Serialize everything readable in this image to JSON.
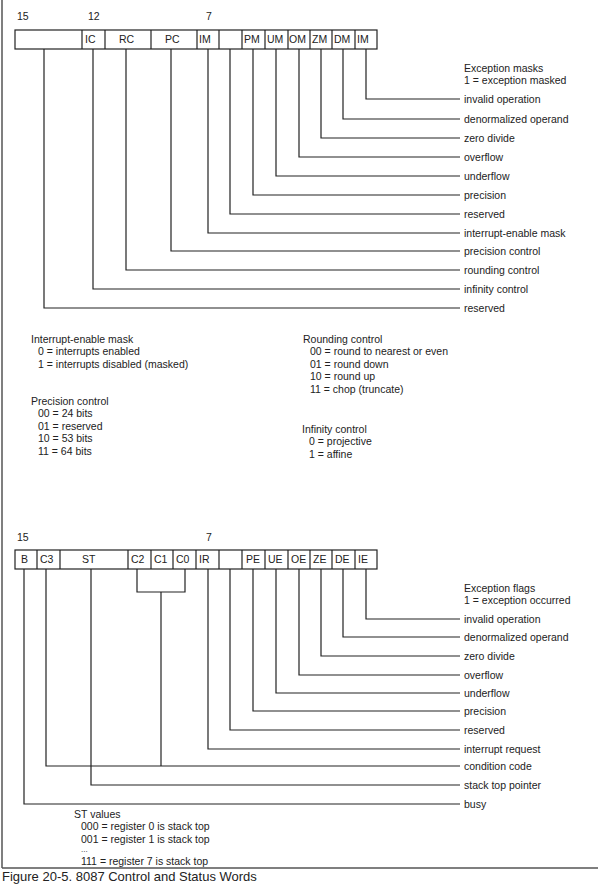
{
  "control_word": {
    "bit_labels": [
      {
        "text": "15",
        "x": 17
      },
      {
        "text": "12",
        "x": 88
      },
      {
        "text": "7",
        "x": 206
      }
    ],
    "cells": [
      {
        "label": "",
        "x1": 15,
        "x2": 82
      },
      {
        "label": "IC",
        "x1": 82,
        "x2": 105
      },
      {
        "label": "RC",
        "x1": 105,
        "x2": 151
      },
      {
        "label": "PC",
        "x1": 151,
        "x2": 197
      },
      {
        "label": "IM",
        "x1": 197,
        "x2": 219
      },
      {
        "label": "",
        "x1": 219,
        "x2": 242
      },
      {
        "label": "PM",
        "x1": 242,
        "x2": 265
      },
      {
        "label": "UM",
        "x1": 265,
        "x2": 288
      },
      {
        "label": "OM",
        "x1": 288,
        "x2": 310
      },
      {
        "label": "ZM",
        "x1": 310,
        "x2": 332
      },
      {
        "label": "DM",
        "x1": 332,
        "x2": 355
      },
      {
        "label": "IM",
        "x1": 355,
        "x2": 377
      }
    ],
    "legend_title": "Exception masks",
    "legend_subtitle": "1 = exception masked",
    "fields": [
      "invalid operation",
      "denormalized operand",
      "zero divide",
      "overflow",
      "underflow",
      "precision",
      "reserved",
      "interrupt-enable mask",
      "precision control",
      "rounding control",
      "infinity control",
      "reserved"
    ]
  },
  "notes": {
    "interrupt_enable": {
      "title": "Interrupt-enable mask",
      "values": [
        "0 = interrupts enabled",
        "1 = interrupts disabled (masked)"
      ]
    },
    "precision_control": {
      "title": "Precision control",
      "values": [
        "00 = 24 bits",
        "01 = reserved",
        "10 = 53 bits",
        "11 = 64 bits"
      ]
    },
    "rounding_control": {
      "title": "Rounding control",
      "values": [
        "00 = round to nearest or even",
        "01 = round down",
        "10 = round up",
        "11 = chop (truncate)"
      ]
    },
    "infinity_control": {
      "title": "Infinity control",
      "values": [
        "0 = projective",
        "1 = affine"
      ]
    }
  },
  "status_word": {
    "bit_labels": [
      {
        "text": "15",
        "x": 17
      },
      {
        "text": "7",
        "x": 206
      }
    ],
    "cells": [
      {
        "label": "B",
        "x1": 15,
        "x2": 37
      },
      {
        "label": "C3",
        "x1": 37,
        "x2": 60
      },
      {
        "label": "ST",
        "x1": 60,
        "x2": 128
      },
      {
        "label": "C2",
        "x1": 128,
        "x2": 151
      },
      {
        "label": "C1",
        "x1": 151,
        "x2": 173
      },
      {
        "label": "C0",
        "x1": 173,
        "x2": 196
      },
      {
        "label": "IR",
        "x1": 196,
        "x2": 219
      },
      {
        "label": "",
        "x1": 219,
        "x2": 242
      },
      {
        "label": "PE",
        "x1": 242,
        "x2": 265
      },
      {
        "label": "UE",
        "x1": 265,
        "x2": 288
      },
      {
        "label": "OE",
        "x1": 288,
        "x2": 310
      },
      {
        "label": "ZE",
        "x1": 310,
        "x2": 332
      },
      {
        "label": "DE",
        "x1": 332,
        "x2": 355
      },
      {
        "label": "IE",
        "x1": 355,
        "x2": 377
      }
    ],
    "legend_title": "Exception flags",
    "legend_subtitle": "1 = exception occurred",
    "fields": [
      "invalid operation",
      "denormalized operand",
      "zero divide",
      "overflow",
      "underflow",
      "precision",
      "reserved",
      "interrupt request",
      "condition code",
      "stack top pointer",
      "busy"
    ],
    "st_values": {
      "title": "ST values",
      "values": [
        "000 = register 0 is stack top",
        "001 = register 1 is stack top",
        "...",
        "111 = register 7 is stack top"
      ]
    }
  },
  "caption": "Figure 20-5. 8087 Control and Status Words",
  "colors": {
    "line": "#222222",
    "frame": "#555555",
    "background": "#ffffff"
  }
}
